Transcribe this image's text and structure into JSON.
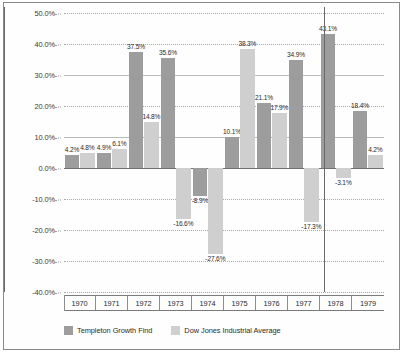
{
  "chart_data": {
    "type": "bar",
    "title": "",
    "subtitle": "",
    "xlabel": "",
    "ylabel": "",
    "categories": [
      "1970",
      "1971",
      "1972",
      "1973",
      "1974",
      "1975",
      "1976",
      "1977",
      "1978",
      "1979"
    ],
    "series": [
      {
        "name": "Templeton Growth Find",
        "color": "#9d9d9d",
        "values": [
          4.2,
          4.9,
          37.5,
          35.6,
          -8.9,
          10.1,
          21.1,
          34.9,
          43.1,
          18.4
        ],
        "labels": [
          "4.2%",
          "4.9%",
          "37.5%",
          "35.6%",
          "-8.9%",
          "10.1%",
          "21.1%",
          "34.9%",
          "43.1%",
          "18.4%"
        ]
      },
      {
        "name": "Dow Jones Industrial Average",
        "color": "#cfcfcf",
        "values": [
          4.8,
          6.1,
          14.8,
          -16.6,
          -27.6,
          38.3,
          17.9,
          -17.3,
          -3.1,
          4.2
        ],
        "labels": [
          "4.8%",
          "6.1%",
          "14.8%",
          "-16.6%",
          "-27.6%",
          "38.3%",
          "17.9%",
          "-17.3%",
          "-3.1%",
          "4.2%"
        ]
      }
    ],
    "ylim": [
      -40,
      50
    ],
    "ytick_values": [
      50,
      40,
      30,
      20,
      10,
      0,
      -10,
      -20,
      -30,
      -40
    ],
    "ytick_labels": [
      "50.0%",
      "40.0%",
      "30.0%",
      "20.0%",
      "10.0%",
      "0.0%",
      "-10.0%",
      "-20.0%",
      "-30.0%",
      "-40.0%"
    ],
    "grid": true,
    "legend_position": "bottom"
  },
  "legend": {
    "items": [
      {
        "label": "Templeton Growth Find"
      },
      {
        "label": "Dow Jones Industrial Average"
      }
    ]
  }
}
